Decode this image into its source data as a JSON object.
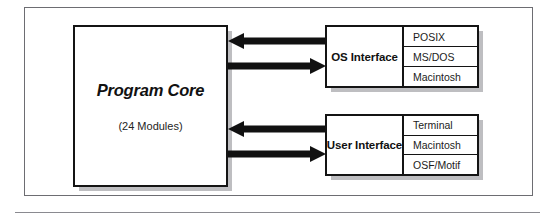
{
  "figure": {
    "type": "block-diagram",
    "core": {
      "title": "Program Core",
      "subtitle": "(24 Modules)"
    },
    "interfaces": [
      {
        "id": "os-interface",
        "label": "OS Interface",
        "options": [
          "POSIX",
          "MS/DOS",
          "Macintosh"
        ]
      },
      {
        "id": "user-interface",
        "label": "User Interface",
        "options": [
          "Terminal",
          "Macintosh",
          "OSF/Motif"
        ]
      }
    ],
    "connectors": [
      {
        "id": "os-inbound",
        "icon": "arrow-left-icon",
        "direction": "left",
        "from": "os-interface",
        "to": "program-core"
      },
      {
        "id": "os-outbound",
        "icon": "arrow-right-icon",
        "direction": "right",
        "from": "program-core",
        "to": "os-interface"
      },
      {
        "id": "user-inbound",
        "icon": "arrow-left-icon",
        "direction": "left",
        "from": "user-interface",
        "to": "program-core"
      },
      {
        "id": "user-outbound",
        "icon": "arrow-right-icon",
        "direction": "right",
        "from": "program-core",
        "to": "user-interface"
      }
    ],
    "colors": {
      "stroke": "#141414",
      "arrow": "#111111",
      "frame": "#6d6d72",
      "shadow": "#78787e",
      "rule": "#8a8a90",
      "background": "#ffffff"
    }
  }
}
